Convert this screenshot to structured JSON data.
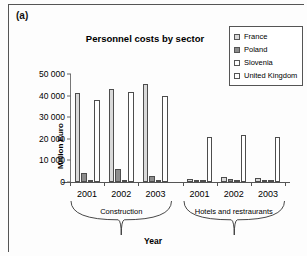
{
  "figure": {
    "panel_label": "(a)",
    "x_axis_title": "Year"
  },
  "chart_data": {
    "type": "bar",
    "title": "Personnel costs by sector",
    "xlabel": "Year",
    "ylabel": "Million Euro",
    "ylim": [
      0,
      50000
    ],
    "yticks": [
      "0",
      "10 000",
      "20 000",
      "30 000",
      "40 000",
      "50 000"
    ],
    "ytick_values": [
      0,
      10000,
      20000,
      30000,
      40000,
      50000
    ],
    "grid": false,
    "legend_position": "top-right",
    "legend": [
      "France",
      "Poland",
      "Slovenia",
      "United Kingdom"
    ],
    "series_colors": [
      "#d9d9d9",
      "#8c8c8c",
      "#ffffff",
      "#ffffff"
    ],
    "categories": [
      "2001",
      "2002",
      "2003",
      "2001",
      "2002",
      "2003"
    ],
    "groups": [
      {
        "label": "Construction",
        "categories": [
          "2001",
          "2002",
          "2003"
        ]
      },
      {
        "label": "Hotels and restraurants",
        "categories": [
          "2001",
          "2002",
          "2003"
        ]
      }
    ],
    "series": [
      {
        "name": "France",
        "values": [
          41200,
          43000,
          45300,
          1400,
          2100,
          2000
        ]
      },
      {
        "name": "Poland",
        "values": [
          4000,
          6100,
          2800,
          600,
          1200,
          500
        ]
      },
      {
        "name": "Slovenia",
        "values": [
          700,
          900,
          800,
          350,
          550,
          450
        ]
      },
      {
        "name": "United Kingdom",
        "values": [
          38000,
          41600,
          40000,
          21000,
          21800,
          20900
        ]
      }
    ]
  }
}
